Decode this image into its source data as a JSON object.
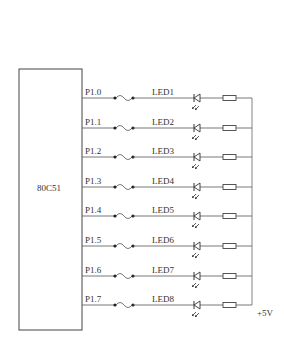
{
  "chip": {
    "label": "80C51",
    "box": {
      "x": 19,
      "y": 69,
      "w": 63,
      "h": 261
    }
  },
  "supply": {
    "label": "+5V",
    "rail_x": 252
  },
  "rows": [
    {
      "pin": "P1.0",
      "led": "LED1",
      "y": 98
    },
    {
      "pin": "P1.1",
      "led": "LED2",
      "y": 128
    },
    {
      "pin": "P1.2",
      "led": "LED3",
      "y": 157
    },
    {
      "pin": "P1.3",
      "led": "LED4",
      "y": 187
    },
    {
      "pin": "P1.4",
      "led": "LED5",
      "y": 216
    },
    {
      "pin": "P1.5",
      "led": "LED6",
      "y": 246
    },
    {
      "pin": "P1.6",
      "led": "LED7",
      "y": 276
    },
    {
      "pin": "P1.7",
      "led": "LED8",
      "y": 305
    }
  ],
  "colors": {
    "line": "#555555",
    "text": "#333333",
    "background": "#ffffff"
  }
}
